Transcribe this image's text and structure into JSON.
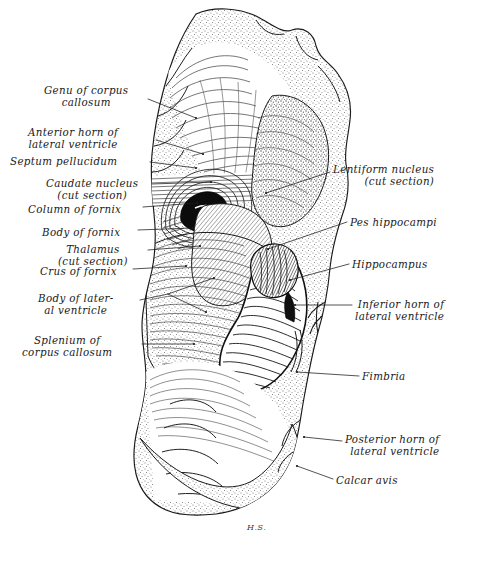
{
  "figure": {
    "signature": "H.S.",
    "background_color": "#ffffff",
    "ink_color": "#1a1a1a",
    "stipple_color": "#6b6b6b"
  },
  "labels_left": [
    {
      "id": "genu-of-corpus-callosum",
      "text": "Genu of corpus\ncallosum",
      "x": 44,
      "y": 84,
      "align": "center",
      "leader": [
        [
          148,
          99
        ],
        [
          196,
          118
        ]
      ]
    },
    {
      "id": "anterior-horn-of-lateral-ventricle",
      "text": "Anterior horn of\nlateral ventricle",
      "x": 28,
      "y": 126,
      "align": "center",
      "leader": [
        [
          156,
          140
        ],
        [
          203,
          154
        ]
      ]
    },
    {
      "id": "septum-pellucidum",
      "text": "Septum pellucidum",
      "x": 10,
      "y": 155,
      "align": "left",
      "leader": [
        [
          150,
          162
        ],
        [
          196,
          168
        ]
      ]
    },
    {
      "id": "caudate-nucleus",
      "text": "Caudate nucleus\n(cut section)",
      "x": 46,
      "y": 177,
      "align": "center",
      "leader": [
        [
          152,
          184
        ],
        [
          211,
          182
        ]
      ]
    },
    {
      "id": "column-of-fornix",
      "text": "Column of fornix",
      "x": 28,
      "y": 203,
      "align": "left",
      "leader": [
        [
          143,
          207
        ],
        [
          197,
          203
        ]
      ]
    },
    {
      "id": "body-of-fornix",
      "text": "Body of fornix",
      "x": 42,
      "y": 226,
      "align": "left",
      "leader": [
        [
          138,
          230
        ],
        [
          193,
          228
        ]
      ]
    },
    {
      "id": "thalamus",
      "text": "Thalamus\n(cut section)",
      "x": 58,
      "y": 243,
      "align": "center",
      "leader": [
        [
          148,
          250
        ],
        [
          200,
          246
        ]
      ]
    },
    {
      "id": "crus-of-fornix",
      "text": "Crus of fornix",
      "x": 40,
      "y": 265,
      "align": "left",
      "leader": [
        [
          133,
          269
        ],
        [
          186,
          266
        ]
      ]
    },
    {
      "id": "body-of-lateral-ventricle",
      "text": "Body of later-\nal ventricle",
      "x": 38,
      "y": 292,
      "align": "center",
      "leader": [
        [
          140,
          300
        ],
        [
          168,
          294
        ]
      ]
    },
    {
      "id": "splenium-of-corpus-callosum",
      "text": "Splenium of\ncorpus callosum",
      "x": 22,
      "y": 334,
      "align": "center",
      "leader": [
        [
          142,
          344
        ],
        [
          194,
          344
        ]
      ]
    }
  ],
  "labels_right": [
    {
      "id": "lentiform-nucleus",
      "text": "Lentiform nucleus\n(cut section)",
      "x": 333,
      "y": 163,
      "align": "left",
      "leader": [
        [
          330,
          172
        ],
        [
          266,
          193
        ]
      ]
    },
    {
      "id": "pes-hippocampi",
      "text": "Pes hippocampi",
      "x": 350,
      "y": 216,
      "align": "left",
      "leader": [
        [
          347,
          222
        ],
        [
          268,
          249
        ]
      ]
    },
    {
      "id": "hippocampus",
      "text": "Hippocampus",
      "x": 352,
      "y": 258,
      "align": "left",
      "leader": [
        [
          349,
          264
        ],
        [
          290,
          280
        ]
      ]
    },
    {
      "id": "inferior-horn-of-lateral-ventricle",
      "text": "Inferior horn of\nlateral ventricle",
      "x": 355,
      "y": 298,
      "align": "left",
      "leader": [
        [
          352,
          305
        ],
        [
          295,
          305
        ]
      ]
    },
    {
      "id": "fimbria",
      "text": "Fimbria",
      "x": 362,
      "y": 370,
      "align": "left",
      "leader": [
        [
          359,
          376
        ],
        [
          297,
          372
        ]
      ]
    },
    {
      "id": "posterior-horn-of-lateral-ventricle",
      "text": "Posterior horn of\nlateral ventricle",
      "x": 345,
      "y": 433,
      "align": "left",
      "leader": [
        [
          342,
          441
        ],
        [
          304,
          437
        ]
      ]
    },
    {
      "id": "calcar-avis",
      "text": "Calcar avis",
      "x": 336,
      "y": 474,
      "align": "left",
      "leader": [
        [
          333,
          479
        ],
        [
          297,
          466
        ]
      ]
    }
  ]
}
